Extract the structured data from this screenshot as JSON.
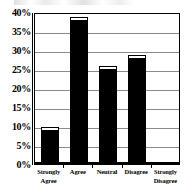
{
  "chart_data": {
    "type": "bar",
    "title": "",
    "subtitle": "",
    "xlabel": "",
    "ylabel": "",
    "categories": [
      "Strongly Agree",
      "Agree",
      "Neutral",
      "Disagree",
      "Strongly Disagree"
    ],
    "category_lines": [
      [
        "Strongly",
        "Agree"
      ],
      [
        "Agree"
      ],
      [
        "Neutral"
      ],
      [
        "Disagree"
      ],
      [
        "Strongly",
        "Disagree"
      ]
    ],
    "values": [
      9,
      38,
      25,
      28,
      0
    ],
    "value_labels": [
      "9%",
      "38%",
      "25%",
      "28%",
      "0%"
    ],
    "ylim": [
      0,
      40
    ],
    "ytick_values": [
      40,
      35,
      30,
      25,
      20,
      15,
      10,
      5,
      0
    ],
    "ytick_labels": [
      "40%",
      "35%",
      "30%",
      "25%",
      "20%",
      "15%",
      "10%",
      "5%",
      "0%"
    ],
    "grid": true,
    "legend": "none",
    "bar_color": "#000000",
    "grid_color": "#8a8a8a",
    "axis_color": "#000000",
    "background_color": "#ffffff"
  }
}
